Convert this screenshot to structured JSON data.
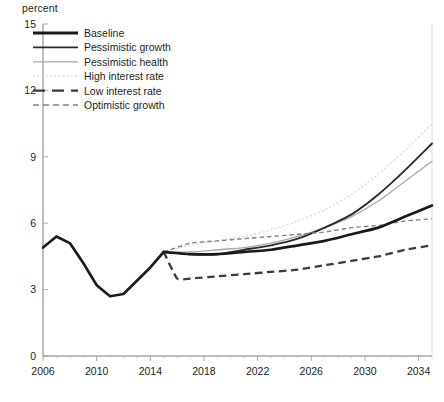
{
  "axis": {
    "y_unit_label": "percent",
    "y_ticks": [
      "0",
      "3",
      "6",
      "9",
      "12",
      "15"
    ],
    "x_ticks": [
      "2006",
      "2010",
      "2014",
      "2018",
      "2022",
      "2026",
      "2030",
      "2034"
    ]
  },
  "legend": {
    "items": [
      {
        "label": "Baseline",
        "style": "thick-solid-black",
        "color": "#1a1a1a"
      },
      {
        "label": "Pessimistic growth",
        "style": "medium-solid-black",
        "color": "#2b2b2b"
      },
      {
        "label": "Pessimistic health",
        "style": "thin-solid-gray",
        "color": "#a6a8ab"
      },
      {
        "label": "High interest rate",
        "style": "thin-dotted-lightgray",
        "color": "#d6d7d9"
      },
      {
        "label": "Low interest rate",
        "style": "thick-dashed-dark",
        "color": "#3b3b3b"
      },
      {
        "label": "Optimistic growth",
        "style": "thin-dashed-gray",
        "color": "#808285"
      }
    ]
  },
  "chart_data": {
    "type": "line",
    "title": "",
    "xlabel": "",
    "ylabel": "percent",
    "xlim": [
      2006,
      2035
    ],
    "ylim": [
      0,
      15
    ],
    "ytick_values": [
      0,
      3,
      6,
      9,
      12,
      15
    ],
    "xtick_values": [
      2006,
      2010,
      2014,
      2018,
      2022,
      2026,
      2030,
      2034
    ],
    "grid": false,
    "legend_position": "top-left",
    "projection_start_year": 2015,
    "series": [
      {
        "name": "Historical",
        "color": "#1a1a1a",
        "x": [
          2006,
          2007,
          2008,
          2009,
          2010,
          2011,
          2012,
          2013,
          2014,
          2015
        ],
        "values": [
          4.9,
          5.4,
          5.1,
          4.2,
          3.2,
          2.7,
          2.8,
          3.4,
          4.0,
          4.7
        ]
      },
      {
        "name": "Baseline",
        "color": "#1a1a1a",
        "x": [
          2015,
          2017,
          2019,
          2021,
          2023,
          2025,
          2027,
          2029,
          2031,
          2033,
          2035
        ],
        "values": [
          4.7,
          4.6,
          4.6,
          4.7,
          4.8,
          5.0,
          5.2,
          5.5,
          5.8,
          6.3,
          6.8
        ]
      },
      {
        "name": "Pessimistic growth",
        "color": "#2b2b2b",
        "x": [
          2015,
          2017,
          2019,
          2021,
          2023,
          2025,
          2027,
          2029,
          2031,
          2033,
          2035
        ],
        "values": [
          4.7,
          4.6,
          4.6,
          4.8,
          5.0,
          5.3,
          5.8,
          6.4,
          7.3,
          8.4,
          9.6
        ]
      },
      {
        "name": "Pessimistic health",
        "color": "#a6a8ab",
        "x": [
          2015,
          2017,
          2019,
          2021,
          2023,
          2025,
          2027,
          2029,
          2031,
          2033,
          2035
        ],
        "values": [
          4.7,
          4.7,
          4.8,
          4.9,
          5.1,
          5.4,
          5.8,
          6.3,
          7.0,
          7.9,
          8.8
        ]
      },
      {
        "name": "High interest rate",
        "color": "#d6d7d9",
        "x": [
          2015,
          2017,
          2019,
          2021,
          2023,
          2025,
          2027,
          2029,
          2031,
          2033,
          2035
        ],
        "values": [
          4.7,
          5.0,
          5.2,
          5.4,
          5.7,
          6.1,
          6.6,
          7.3,
          8.2,
          9.3,
          10.5
        ]
      },
      {
        "name": "Low interest rate",
        "color": "#3b3b3b",
        "x": [
          2015,
          2016,
          2017,
          2019,
          2021,
          2023,
          2025,
          2027,
          2029,
          2031,
          2033,
          2035
        ],
        "values": [
          4.7,
          3.5,
          3.5,
          3.6,
          3.7,
          3.8,
          3.9,
          4.1,
          4.3,
          4.5,
          4.8,
          5.0
        ]
      },
      {
        "name": "Optimistic growth",
        "color": "#808285",
        "x": [
          2015,
          2017,
          2019,
          2021,
          2023,
          2025,
          2027,
          2029,
          2031,
          2033,
          2035
        ],
        "values": [
          4.7,
          5.1,
          5.2,
          5.3,
          5.4,
          5.5,
          5.6,
          5.8,
          5.9,
          6.1,
          6.2
        ]
      }
    ]
  }
}
